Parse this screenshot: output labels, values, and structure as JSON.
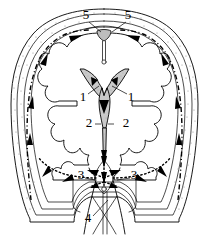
{
  "figure": {
    "background_color": "#ffffff",
    "ink_color": "#000000",
    "ventricle_fill_color": "#c9c9c9",
    "granulation_fill_color": "#bdbdbd",
    "stipple_color": "#8f8f8f",
    "width": 209,
    "height": 235
  },
  "labels": [
    {
      "id": "label-5-left",
      "text": "5",
      "x": 86,
      "y": 16
    },
    {
      "id": "label-5-right",
      "text": "5",
      "x": 128,
      "y": 16
    },
    {
      "id": "label-1-left",
      "text": "1",
      "x": 83,
      "y": 98
    },
    {
      "id": "label-1-right",
      "text": "1",
      "x": 131,
      "y": 98
    },
    {
      "id": "label-2-left",
      "text": "2",
      "x": 89,
      "y": 124
    },
    {
      "id": "label-2-right",
      "text": "2",
      "x": 126,
      "y": 124
    },
    {
      "id": "label-3-left",
      "text": "3",
      "x": 81,
      "y": 176
    },
    {
      "id": "label-3-right",
      "text": "3",
      "x": 134,
      "y": 176
    },
    {
      "id": "label-4",
      "text": "4",
      "x": 88,
      "y": 219
    }
  ],
  "label_legend": [
    {
      "number": "1",
      "structure": "lateral ventricle"
    },
    {
      "number": "2",
      "structure": "third ventricle"
    },
    {
      "number": "3",
      "structure": "lateral aperture / foramen"
    },
    {
      "number": "4",
      "structure": "central canal of spinal cord"
    },
    {
      "number": "5",
      "structure": "arachnoid granulation / superior sagittal sinus"
    }
  ],
  "dash_patterns": {
    "flow_dash": "5 3",
    "flow_dash_dot": "5 2.5 1 2.5",
    "flow_dot": "1.4 2.6"
  }
}
